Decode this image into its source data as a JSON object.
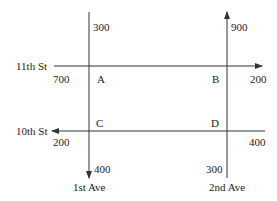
{
  "streets": {
    "eleventh": {
      "name": "11th St",
      "direction": "east"
    },
    "tenth": {
      "name": "10th St",
      "direction": "west"
    }
  },
  "avenues": {
    "first": {
      "name": "1st Ave",
      "direction": "south"
    },
    "second": {
      "name": "2nd Ave",
      "direction": "north"
    }
  },
  "intersections": {
    "A": "A",
    "B": "B",
    "C": "C",
    "D": "D"
  },
  "flows": {
    "eleventh_in_west": "700",
    "eleventh_out_east": "200",
    "tenth_in_east": "400",
    "tenth_out_west": "200",
    "first_in_north": "300",
    "first_out_south": "400",
    "second_in_south": "300",
    "second_out_north": "900"
  },
  "colors": {
    "line": "#333333",
    "text": "#222222",
    "background": "#ffffff"
  }
}
